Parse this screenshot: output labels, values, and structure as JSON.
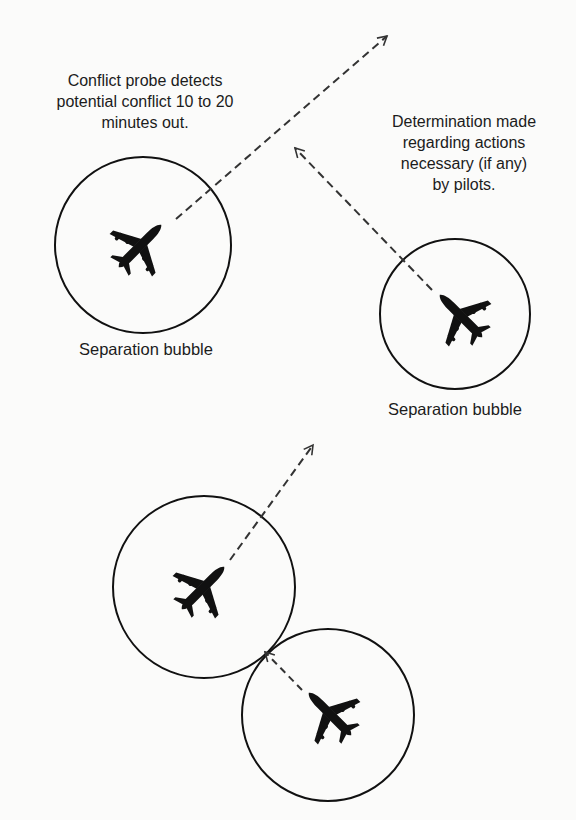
{
  "diagram": {
    "captions": {
      "conflict_probe": "Conflict probe detects\npotential conflict 10 to 20\nminutes out.",
      "determination": "Determination made\nregarding actions\nnecessary (if any)\nby pilots."
    },
    "bubble_labels": {
      "left": "Separation bubble",
      "right": "Separation bubble"
    },
    "bubbles": [
      {
        "id": "bubble-1",
        "cx": 143,
        "cy": 245,
        "r": 88
      },
      {
        "id": "bubble-2",
        "cx": 455,
        "cy": 314,
        "r": 75
      },
      {
        "id": "bubble-3",
        "cx": 204,
        "cy": 587,
        "r": 91
      },
      {
        "id": "bubble-4",
        "cx": 328,
        "cy": 715,
        "r": 86
      }
    ],
    "aircraft": [
      {
        "id": "aircraft-1",
        "cx": 140,
        "cy": 246,
        "heading_deg": 45
      },
      {
        "id": "aircraft-2",
        "cx": 461,
        "cy": 316,
        "heading_deg": -45
      },
      {
        "id": "aircraft-3",
        "cx": 203,
        "cy": 588,
        "heading_deg": 45
      },
      {
        "id": "aircraft-4",
        "cx": 330,
        "cy": 714,
        "heading_deg": -45
      }
    ],
    "trajectories": [
      {
        "id": "trajectory-1",
        "x1": 176,
        "y1": 219,
        "x2": 387,
        "y2": 36
      },
      {
        "id": "trajectory-2",
        "x1": 432,
        "y1": 290,
        "x2": 295,
        "y2": 148
      },
      {
        "id": "trajectory-3",
        "x1": 230,
        "y1": 560,
        "x2": 313,
        "y2": 445
      },
      {
        "id": "trajectory-4",
        "x1": 302,
        "y1": 690,
        "x2": 265,
        "y2": 652
      }
    ],
    "colors": {
      "stroke": "#111111",
      "dash": "#333333",
      "background": "#fbfbfa"
    }
  }
}
